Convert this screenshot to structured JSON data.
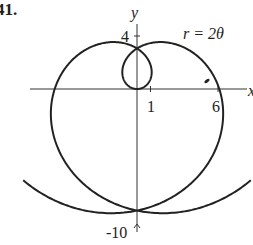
{
  "figure": {
    "problem_number": "41.",
    "equation": "r = 2θ"
  },
  "chart_data": {
    "type": "line",
    "subtype": "polar",
    "title": "",
    "equation": "r = 2θ",
    "xlabel": "x",
    "ylabel": "y",
    "tick_labels": {
      "x": [
        "1",
        "6"
      ],
      "y": [
        "4",
        "-10"
      ]
    },
    "ticks": {
      "x": [
        1,
        6
      ],
      "y": [
        4,
        -10
      ]
    },
    "theta_range": [
      -5.6,
      5.6
    ],
    "xlim": [
      -8.2,
      8.3
    ],
    "ylim": [
      -11,
      6.6
    ],
    "grid": false,
    "legend": false,
    "key_points": [
      {
        "label": "top crossing",
        "x": 0,
        "y": 3.14
      },
      {
        "label": "x-intercept",
        "x": 6.28,
        "y": 0
      },
      {
        "label": "bottom crossing",
        "x": 0,
        "y": -9.42
      }
    ],
    "series": [
      {
        "name": "r = 2θ",
        "color": "#222222"
      }
    ]
  }
}
